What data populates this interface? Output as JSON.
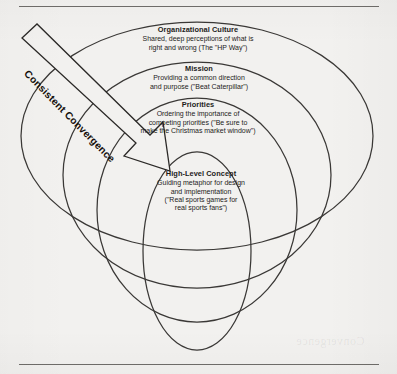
{
  "figure": {
    "name": "consistent-convergence-nested-circles",
    "background_color": "#f2f1ef",
    "stroke_color": "#3a3836",
    "text_color": "#1d1c1b"
  },
  "arrow": {
    "label": "Consistent Convergence",
    "direction": "top-left-to-center",
    "style": "hollow-outlined-block-arrow"
  },
  "rings": [
    {
      "id": "organizational-culture",
      "title": "Organizational Culture",
      "description_lines": [
        "Shared, deep perceptions of what is",
        "right and wrong (The \"HP Way\")"
      ]
    },
    {
      "id": "mission",
      "title": "Mission",
      "description_lines": [
        "Providing a common direction",
        "and purpose (\"Beat Caterpillar\")"
      ]
    },
    {
      "id": "priorities",
      "title": "Priorities",
      "description_lines": [
        "Ordering the importance of",
        "competing priorities (\"Be sure to",
        "make the Christmas market window\")"
      ]
    },
    {
      "id": "high-level-concept",
      "title": "High-Level Concept",
      "description_lines": [
        "Guiding metaphor for design",
        "and implementation",
        "(\"Real sports games for",
        "real sports fans\")"
      ]
    }
  ],
  "bleed_through": {
    "fragments": [
      "Convergence"
    ]
  }
}
